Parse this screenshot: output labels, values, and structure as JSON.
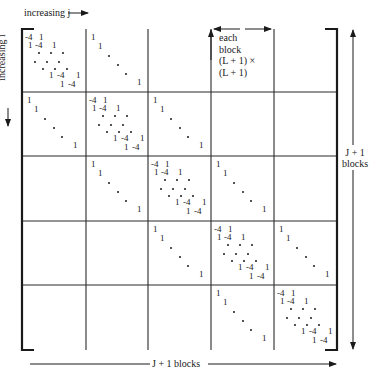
{
  "figure": {
    "type": "block-tridiagonal-matrix",
    "labels": {
      "top_axis": "increasing j",
      "left_axis": "increasing i",
      "right_blocks": [
        "J + 1",
        "blocks"
      ],
      "bottom_blocks": "J + 1 blocks",
      "block_size": [
        "each",
        "block",
        "(L + 1) ×",
        "(L + 1)"
      ]
    },
    "grid": {
      "rows": 5,
      "cols": 5,
      "x_lines": [
        22,
        86,
        148,
        211,
        274,
        337
      ],
      "y_lines": [
        29,
        92,
        156,
        221,
        285,
        350
      ]
    },
    "block_types": {
      "T": "tridiagonal block: diagonal -4, off-diagonals 1",
      "I": "identity block: 1 on diagonal",
      "0": "zero block"
    },
    "structure": [
      [
        "T",
        "I",
        "0",
        "0",
        "0"
      ],
      [
        "I",
        "T",
        "I",
        "0",
        "0"
      ],
      [
        "0",
        "I",
        "T",
        "I",
        "0"
      ],
      [
        "0",
        "0",
        "I",
        "T",
        "I"
      ],
      [
        "0",
        "0",
        "0",
        "I",
        "T"
      ]
    ],
    "entries": {
      "diag": "-4",
      "off": "1",
      "one": "1"
    },
    "caption_partial": "Figure caption (cut off at bottom edge)"
  }
}
